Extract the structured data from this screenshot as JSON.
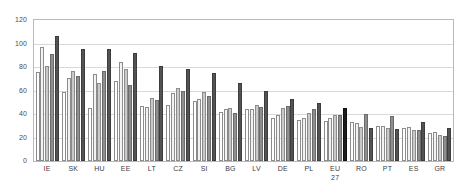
{
  "chart_data": {
    "type": "bar",
    "title": "",
    "xlabel": "",
    "ylabel": "",
    "ylim": [
      0,
      120
    ],
    "ytick_step": 20,
    "yticks": [
      0,
      20,
      40,
      60,
      80,
      100,
      120
    ],
    "grid": true,
    "legend_position": "top-center",
    "highlight_category": "EU 27",
    "categories": [
      "IE",
      "SK",
      "HU",
      "EE",
      "LT",
      "CZ",
      "SI",
      "BG",
      "LV",
      "DE",
      "PL",
      "EU 27",
      "RO",
      "PT",
      "ES",
      "GR"
    ],
    "category_labels": [
      {
        "line1": "IE",
        "line2": ""
      },
      {
        "line1": "SK",
        "line2": ""
      },
      {
        "line1": "HU",
        "line2": ""
      },
      {
        "line1": "EE",
        "line2": ""
      },
      {
        "line1": "LT",
        "line2": ""
      },
      {
        "line1": "CZ",
        "line2": ""
      },
      {
        "line1": "SI",
        "line2": ""
      },
      {
        "line1": "BG",
        "line2": ""
      },
      {
        "line1": "LV",
        "line2": ""
      },
      {
        "line1": "DE",
        "line2": ""
      },
      {
        "line1": "PL",
        "line2": ""
      },
      {
        "line1": "EU",
        "line2": "27"
      },
      {
        "line1": "RO",
        "line2": ""
      },
      {
        "line1": "PT",
        "line2": ""
      },
      {
        "line1": "ES",
        "line2": ""
      },
      {
        "line1": "GR",
        "line2": ""
      }
    ],
    "series": [
      {
        "name": "1995",
        "color": "#ffffff",
        "values": [
          76,
          59,
          45,
          68,
          47,
          48,
          51,
          42,
          44,
          37,
          35,
          34,
          33,
          30,
          28,
          24
        ]
      },
      {
        "name": "2000",
        "color": "#f2f2f2",
        "values": [
          97,
          71,
          74,
          84,
          46,
          58,
          53,
          44,
          44,
          39,
          37,
          37,
          32,
          30,
          29,
          25
        ]
      },
      {
        "name": "2005",
        "color": "#c9c9c9",
        "values": [
          81,
          77,
          66,
          78,
          54,
          62,
          59,
          45,
          48,
          45,
          41,
          39,
          29,
          28,
          26,
          22
        ]
      },
      {
        "name": "2009",
        "color": "#8f8f8f",
        "values": [
          91,
          72,
          77,
          65,
          52,
          60,
          55,
          41,
          46,
          47,
          44,
          39,
          40,
          38,
          26,
          21
        ]
      },
      {
        "name": "2012",
        "color": "#535353",
        "values": [
          106,
          95,
          95,
          92,
          81,
          78,
          75,
          66,
          60,
          53,
          49,
          45,
          28,
          27,
          33,
          28
        ]
      }
    ]
  }
}
